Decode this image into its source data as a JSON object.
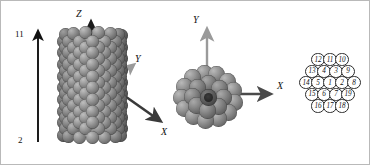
{
  "figure": {
    "background_color": "#ffffff",
    "border_color": "#b9b9b9"
  },
  "length_scale": {
    "top_label": "11",
    "bottom_label": "2",
    "arrow_color": "#111111"
  },
  "panel_side_view": {
    "name": "nanorod-side-view",
    "axes": [
      {
        "label": "Z",
        "direction": "up",
        "color": "#1a1a1a"
      },
      {
        "label": "Y",
        "direction": "up-right",
        "color": "#9a9a9a"
      },
      {
        "label": "X",
        "direction": "down-right",
        "color": "#3a3a3a"
      }
    ],
    "sphere_color": "#7b7b7b",
    "rows": 18,
    "columns": 7
  },
  "panel_top_view": {
    "name": "nanorod-top-view",
    "axes": [
      {
        "label": "Y",
        "direction": "up",
        "color": "#9a9a9a"
      },
      {
        "label": "X",
        "direction": "right",
        "color": "#4a4a4a"
      }
    ],
    "sphere_color": "#7b7b7b",
    "shell_count": 19
  },
  "hex_index": {
    "name": "hexagonal-index-map",
    "rows": [
      [
        "12",
        "11",
        "10"
      ],
      [
        "13",
        "4",
        "3",
        "9"
      ],
      [
        "14",
        "5",
        "1",
        "2",
        "8"
      ],
      [
        "15",
        "6",
        "7",
        "19"
      ],
      [
        "16",
        "17",
        "18"
      ]
    ],
    "cell_fill": "#ffffff",
    "cell_stroke": "#2b2b2b"
  }
}
